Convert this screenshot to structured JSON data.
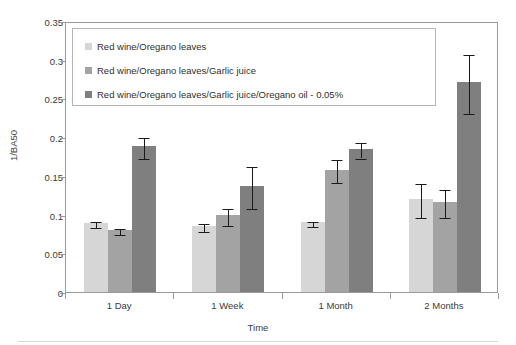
{
  "chart_data": {
    "type": "bar",
    "title": "",
    "xlabel": "Time",
    "ylabel": "1/BA50",
    "categories": [
      "1 Day",
      "1 Week",
      "1 Month",
      "2 Months"
    ],
    "ylim": [
      0,
      0.35
    ],
    "yticks": [
      "0",
      "0.05",
      "0.1",
      "0.15",
      "0.2",
      "0.25",
      "0.3",
      "0.35"
    ],
    "ytick_values": [
      0,
      0.05,
      0.1,
      0.15,
      0.2,
      0.25,
      0.3,
      0.35
    ],
    "grid": false,
    "legend_position": "upper-left-inside",
    "error_bar_type": "symmetric",
    "series": [
      {
        "name": "Red wine/Oregano leaves",
        "color": "#d6d6d6",
        "values": [
          0.089,
          0.085,
          0.09,
          0.12
        ],
        "errors": [
          0.004,
          0.005,
          0.003,
          0.022
        ]
      },
      {
        "name": "Red wine/Oregano leaves/Garlic juice",
        "color": "#a3a3a3",
        "values": [
          0.08,
          0.099,
          0.158,
          0.116
        ],
        "errors": [
          0.004,
          0.011,
          0.015,
          0.018
        ]
      },
      {
        "name": "Red wine/Oregano leaves/Garlic juice/Oregano oil - 0.05%",
        "color": "#7f7f7f",
        "values": [
          0.188,
          0.137,
          0.185,
          0.271
        ],
        "errors": [
          0.014,
          0.027,
          0.01,
          0.038
        ]
      }
    ]
  },
  "axes": {
    "y_title": "1/BA50",
    "x_title": "Time"
  },
  "legend": {
    "entries": [
      "Red wine/Oregano leaves",
      "Red wine/Oregano leaves/Garlic juice",
      "Red wine/Oregano leaves/Garlic juice/Oregano oil - 0.05%"
    ]
  }
}
